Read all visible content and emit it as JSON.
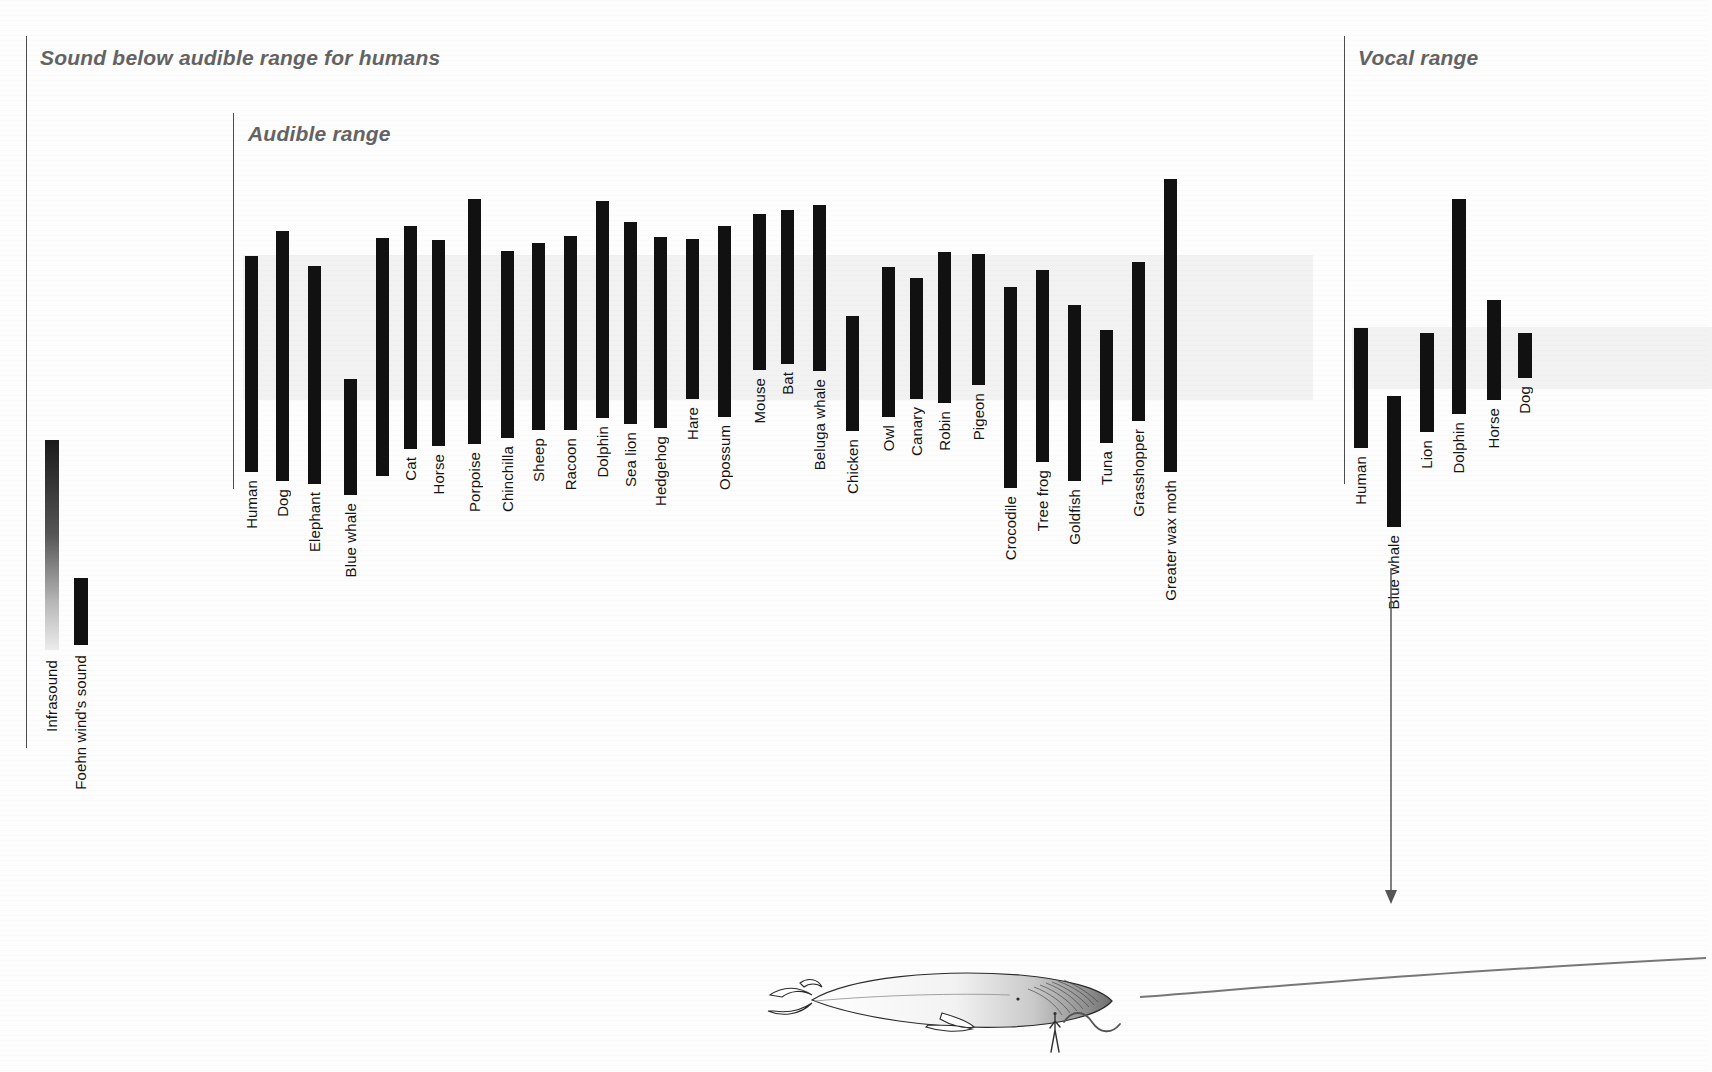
{
  "sections": {
    "infrasound": {
      "title": "Sound below audible range for humans",
      "rule_x": 26,
      "rule_y": 36,
      "rule_h": 712
    },
    "audible": {
      "title": "Audible range",
      "rule_x": 233,
      "rule_y": 113,
      "rule_h": 376
    },
    "vocal": {
      "title": "Vocal range",
      "rule_x": 1344,
      "rule_y": 36,
      "rule_h": 448
    }
  },
  "chart_data": {
    "type": "bar",
    "orientation": "vertical-ranges",
    "note": "Each bar spans an animal's frequency range; bar top = upper limit, bar bottom = lower limit. Axis is unlabelled (logarithmic frequency, low at bottom).",
    "grid": false,
    "legend_position": "none",
    "panels": [
      {
        "name": "infrasound",
        "label": "Sound below audible range for humans",
        "bars": [
          {
            "label": "Infrasound",
            "x": 45,
            "w": 14,
            "top": 440,
            "bottom": 650,
            "gradient": true,
            "label_y": 660
          },
          {
            "label": "Foehn wind's sound",
            "x": 74,
            "w": 14,
            "top": 578,
            "bottom": 645,
            "gradient": false,
            "label_y": 655
          }
        ]
      },
      {
        "name": "audible",
        "label": "Audible range",
        "human_band": {
          "x": 243,
          "y": 255,
          "w": 1070,
          "h": 145
        },
        "bars": [
          {
            "label": "Human",
            "x": 245,
            "w": 13,
            "top": 256,
            "bottom": 472,
            "label_y": 480
          },
          {
            "label": "Dog",
            "x": 276,
            "w": 13,
            "top": 231,
            "bottom": 481,
            "label_y": 489
          },
          {
            "label": "Elephant",
            "x": 308,
            "w": 13,
            "top": 266,
            "bottom": 484,
            "label_y": 492
          },
          {
            "label": "Blue whale",
            "x": 344,
            "w": 13,
            "top": 379,
            "bottom": 495,
            "label_y": 503
          },
          {
            "label": "Cow",
            "x": 376,
            "w": 13,
            "top": 238,
            "bottom": 476,
            "label_y": 444
          },
          {
            "label": "Cat",
            "x": 404,
            "w": 13,
            "top": 226,
            "bottom": 449,
            "label_y": 457
          },
          {
            "label": "Horse",
            "x": 432,
            "w": 13,
            "top": 240,
            "bottom": 446,
            "label_y": 454
          },
          {
            "label": "Porpoise",
            "x": 468,
            "w": 13,
            "top": 199,
            "bottom": 444,
            "label_y": 452
          },
          {
            "label": "Chinchilla",
            "x": 501,
            "w": 13,
            "top": 251,
            "bottom": 438,
            "label_y": 446
          },
          {
            "label": "Sheep",
            "x": 532,
            "w": 13,
            "top": 243,
            "bottom": 430,
            "label_y": 438
          },
          {
            "label": "Racoon",
            "x": 564,
            "w": 13,
            "top": 236,
            "bottom": 430,
            "label_y": 438
          },
          {
            "label": "Dolphin",
            "x": 596,
            "w": 13,
            "top": 201,
            "bottom": 418,
            "label_y": 426
          },
          {
            "label": "Sea lion",
            "x": 624,
            "w": 13,
            "top": 222,
            "bottom": 424,
            "label_y": 432
          },
          {
            "label": "Hedgehog",
            "x": 654,
            "w": 13,
            "top": 237,
            "bottom": 428,
            "label_y": 436
          },
          {
            "label": "Hare",
            "x": 686,
            "w": 13,
            "top": 239,
            "bottom": 399,
            "label_y": 407
          },
          {
            "label": "Opossum",
            "x": 718,
            "w": 13,
            "top": 226,
            "bottom": 417,
            "label_y": 425
          },
          {
            "label": "Mouse",
            "x": 753,
            "w": 13,
            "top": 214,
            "bottom": 370,
            "label_y": 378
          },
          {
            "label": "Bat",
            "x": 781,
            "w": 13,
            "top": 210,
            "bottom": 364,
            "label_y": 372
          },
          {
            "label": "Beluga whale",
            "x": 813,
            "w": 13,
            "top": 205,
            "bottom": 371,
            "label_y": 379
          },
          {
            "label": "Chicken",
            "x": 846,
            "w": 13,
            "top": 316,
            "bottom": 431,
            "label_y": 439
          },
          {
            "label": "Owl",
            "x": 882,
            "w": 13,
            "top": 267,
            "bottom": 417,
            "label_y": 425
          },
          {
            "label": "Canary",
            "x": 910,
            "w": 13,
            "top": 278,
            "bottom": 399,
            "label_y": 407
          },
          {
            "label": "Robin",
            "x": 938,
            "w": 13,
            "top": 252,
            "bottom": 403,
            "label_y": 411
          },
          {
            "label": "Pigeon",
            "x": 972,
            "w": 13,
            "top": 254,
            "bottom": 385,
            "label_y": 393
          },
          {
            "label": "Crocodile",
            "x": 1004,
            "w": 13,
            "top": 287,
            "bottom": 488,
            "label_y": 496
          },
          {
            "label": "Tree frog",
            "x": 1036,
            "w": 13,
            "top": 270,
            "bottom": 462,
            "label_y": 470
          },
          {
            "label": "Goldfish",
            "x": 1068,
            "w": 13,
            "top": 305,
            "bottom": 481,
            "label_y": 489
          },
          {
            "label": "Tuna",
            "x": 1100,
            "w": 13,
            "top": 330,
            "bottom": 443,
            "label_y": 451
          },
          {
            "label": "Grasshopper",
            "x": 1132,
            "w": 13,
            "top": 262,
            "bottom": 421,
            "label_y": 429
          },
          {
            "label": "Greater wax moth",
            "x": 1164,
            "w": 13,
            "top": 179,
            "bottom": 472,
            "label_y": 480
          }
        ]
      },
      {
        "name": "vocal",
        "label": "Vocal range",
        "human_band": {
          "x": 1352,
          "w": 360,
          "y": 327,
          "h": 62
        },
        "bars": [
          {
            "label": "Human",
            "x": 1354,
            "w": 14,
            "top": 328,
            "bottom": 448,
            "label_y": 456
          },
          {
            "label": "Blue whale",
            "x": 1387,
            "w": 14,
            "top": 396,
            "bottom": 527,
            "label_y": 535
          },
          {
            "label": "Lion",
            "x": 1420,
            "w": 14,
            "top": 333,
            "bottom": 432,
            "label_y": 440
          },
          {
            "label": "Dolphin",
            "x": 1452,
            "w": 14,
            "top": 199,
            "bottom": 414,
            "label_y": 422
          },
          {
            "label": "Horse",
            "x": 1487,
            "w": 14,
            "top": 300,
            "bottom": 400,
            "label_y": 408
          },
          {
            "label": "Dog",
            "x": 1518,
            "w": 14,
            "top": 333,
            "bottom": 378,
            "label_y": 386
          }
        ]
      }
    ]
  },
  "illustration": {
    "whale_name": "blue-whale",
    "human_scale_figure": "human-silhouette",
    "sound_wave": "sound-wave-squiggle",
    "callout_arrow": "blue-whale-call-arrow"
  },
  "colors": {
    "bar": "#111111",
    "title": "#636363",
    "rule": "#4d4d4d",
    "band": "rgba(0,0,0,0.045)",
    "label": "#141414",
    "background": "#fdfdfd"
  }
}
